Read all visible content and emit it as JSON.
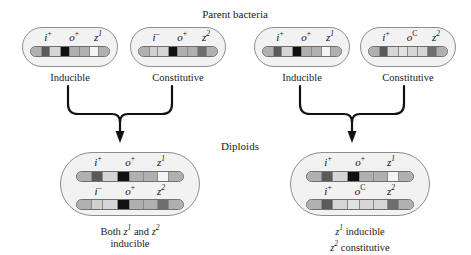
{
  "figure": {
    "title_top": "Parent bacteria",
    "title_middle": "Diploids"
  },
  "parents": [
    {
      "id": "parent-left-inducible",
      "caption": "Inducible",
      "alleles": [
        {
          "gene": "i",
          "sup": "+"
        },
        {
          "gene": "o",
          "sup": "+"
        },
        {
          "gene": "z",
          "sup": "1"
        }
      ]
    },
    {
      "id": "parent-left-constitutive",
      "caption": "Constitutive",
      "alleles": [
        {
          "gene": "i",
          "sup": "–"
        },
        {
          "gene": "o",
          "sup": "+"
        },
        {
          "gene": "z",
          "sup": "2"
        }
      ]
    },
    {
      "id": "parent-right-inducible",
      "caption": "Inducible",
      "alleles": [
        {
          "gene": "i",
          "sup": "+"
        },
        {
          "gene": "o",
          "sup": "+"
        },
        {
          "gene": "z",
          "sup": "1"
        }
      ]
    },
    {
      "id": "parent-right-constitutive",
      "caption": "Constitutive",
      "alleles": [
        {
          "gene": "i",
          "sup": "+"
        },
        {
          "gene": "o",
          "sup": "C"
        },
        {
          "gene": "z",
          "sup": "2"
        }
      ]
    }
  ],
  "diploids": [
    {
      "id": "diploid-left",
      "caption_line1": "Both z1 and z2",
      "caption_line2": "inducible",
      "chromosome_top_alleles": [
        {
          "gene": "i",
          "sup": "+"
        },
        {
          "gene": "o",
          "sup": "+"
        },
        {
          "gene": "z",
          "sup": "1"
        }
      ],
      "chromosome_bottom_alleles": [
        {
          "gene": "i",
          "sup": "–"
        },
        {
          "gene": "o",
          "sup": "+"
        },
        {
          "gene": "z",
          "sup": "2"
        }
      ]
    },
    {
      "id": "diploid-right",
      "caption_line1": "z1 inducible",
      "caption_line2": "z2 constitutive",
      "chromosome_top_alleles": [
        {
          "gene": "i",
          "sup": "+"
        },
        {
          "gene": "o",
          "sup": "+"
        },
        {
          "gene": "z",
          "sup": "1"
        }
      ],
      "chromosome_bottom_alleles": [
        {
          "gene": "i",
          "sup": "+"
        },
        {
          "gene": "o",
          "sup": "C"
        },
        {
          "gene": "z",
          "sup": "2"
        }
      ]
    }
  ],
  "colors": {
    "cell_fill": "#f2f2f2",
    "cell_stroke": "#8d8d8d",
    "bar_base": "#b9b9b9",
    "segment_light": "#d6d6d6",
    "segment_mid": "#b0b0b0",
    "segment_dark": "#5a5a5a",
    "segment_black": "#111111",
    "segment_white": "#f4f4f4",
    "arrow": "#111111",
    "text": "#1a1a1a"
  },
  "segment_patterns": {
    "i_plus_o_plus_z1": [
      "mid",
      "dark",
      "light",
      "black",
      "mid",
      "mid",
      "white",
      "mid"
    ],
    "i_minus_o_plus_z2": [
      "mid",
      "light",
      "light",
      "black",
      "mid",
      "mid",
      "dark",
      "mid"
    ],
    "i_plus_o_c_z2": [
      "mid",
      "dark",
      "light",
      "light",
      "light",
      "light",
      "dark",
      "mid"
    ]
  }
}
